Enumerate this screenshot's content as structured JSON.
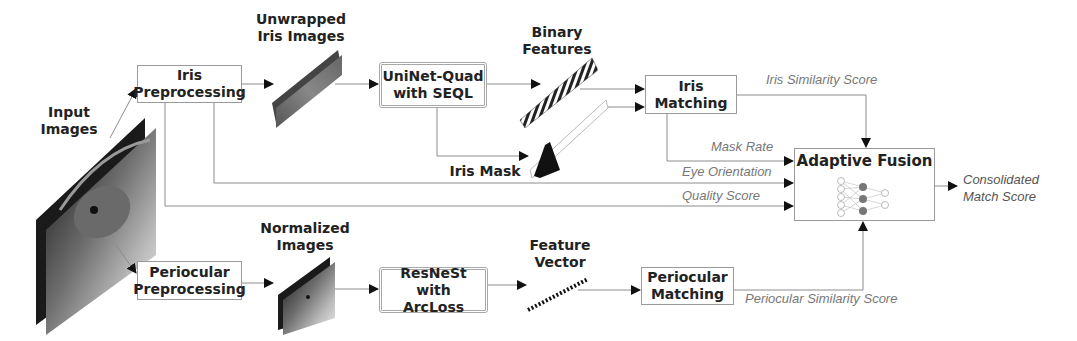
{
  "diagram": {
    "input": {
      "label": "Input\nImages",
      "image": "stacked-eye-images"
    },
    "iris_branch": {
      "preprocessing": "Iris\nPreprocessing",
      "unwrapped_label": "Unwrapped\nIris Images",
      "network": "UniNet-Quad\nwith SEQL",
      "binary_features_label": "Binary\nFeatures",
      "iris_mask_label": "Iris Mask",
      "matching": "Iris\nMatching",
      "similarity_label": "Iris Similarity Score"
    },
    "periocular_branch": {
      "preprocessing": "Periocular\nPreprocessing",
      "normalized_label": "Normalized\nImages",
      "network": "ResNeSt with\nArcLoss",
      "feature_vector_label": "Feature\nVector",
      "matching": "Periocular\nMatching",
      "similarity_label": "Periocular Similarity Score"
    },
    "fusion_inputs": {
      "mask_rate": "Mask Rate",
      "eye_orientation": "Eye Orientation",
      "quality_score": "Quality Score"
    },
    "fusion": {
      "title": "Adaptive Fusion",
      "icon": "neural-network-icon"
    },
    "output": {
      "label": "Consolidated\nMatch Score"
    },
    "colors": {
      "line": "#8c8c8c",
      "arrow": "#111111",
      "box_border": "#9a9a9a",
      "italic_text": "#777777"
    }
  }
}
